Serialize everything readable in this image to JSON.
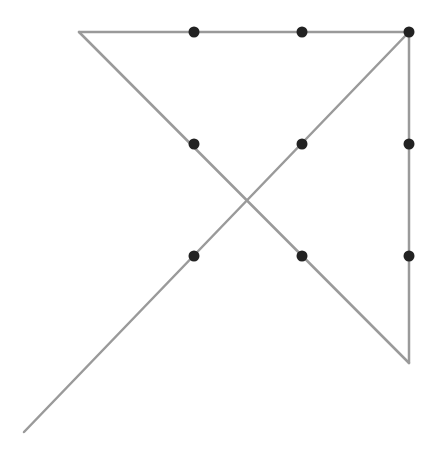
{
  "diagram": {
    "title": "",
    "type": "nine-dots-four-lines-puzzle",
    "line_color": "#9a9a9a",
    "dot_color": "#222222",
    "line_width": 2.5,
    "dot_radius": 5.5,
    "dots": [
      {
        "x": 194,
        "y": 32
      },
      {
        "x": 302,
        "y": 32
      },
      {
        "x": 409,
        "y": 32
      },
      {
        "x": 194,
        "y": 144
      },
      {
        "x": 302,
        "y": 144
      },
      {
        "x": 409,
        "y": 144
      },
      {
        "x": 194,
        "y": 256
      },
      {
        "x": 302,
        "y": 256
      },
      {
        "x": 409,
        "y": 256
      }
    ],
    "lines": [
      {
        "x1": 79,
        "y1": 32,
        "x2": 409,
        "y2": 32
      },
      {
        "x1": 409,
        "y1": 32,
        "x2": 409,
        "y2": 363
      },
      {
        "x1": 409,
        "y1": 363,
        "x2": 79,
        "y2": 32
      },
      {
        "x1": 24,
        "y1": 432,
        "x2": 409,
        "y2": 32
      }
    ]
  }
}
